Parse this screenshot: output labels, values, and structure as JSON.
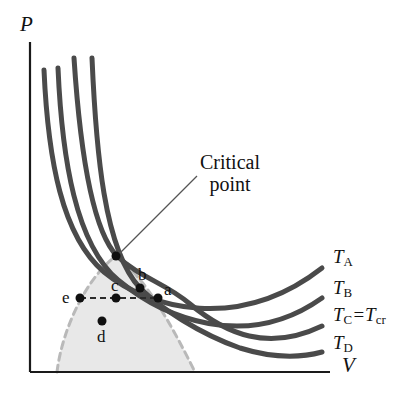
{
  "figure": {
    "kind": "pv-isotherm-diagram",
    "background": "#ffffff",
    "width": 409,
    "height": 399
  },
  "axes": {
    "y_label": "P",
    "x_label": "V",
    "color": "#1a1a1a",
    "origin": {
      "x": 30,
      "y": 372
    },
    "y_top": 42,
    "x_right": 330
  },
  "annotations": {
    "critical_point": {
      "line1": "Critical",
      "line2": "point",
      "text_x": 200,
      "text_y": 152,
      "leader_from": {
        "x": 197,
        "y": 176
      },
      "leader_to": {
        "x": 117,
        "y": 256
      }
    }
  },
  "curves": {
    "stroke": "#4a4a4a",
    "width": 5,
    "items": [
      {
        "id": "T_A",
        "label_main": "T",
        "label_sub": "A",
        "label_x": 333,
        "label_y": 258,
        "path": "M 44,70 C 48,160 62,236 104,272 C 150,310 240,332 322,268"
      },
      {
        "id": "T_B",
        "label_main": "T",
        "label_sub": "B",
        "label_x": 333,
        "label_y": 289,
        "path": "M 58,68 C 62,160 76,244 118,280 C 164,318 246,352 322,298"
      },
      {
        "id": "T_C",
        "label_main": "T",
        "label_sub": "C",
        "label_eq": "=",
        "label_main2": "T",
        "label_sub2": "cr",
        "label_x": 333,
        "label_y": 315,
        "path": "M 74,58 C 80,150 92,230 117,256 C 140,278 164,282 190,304 C 226,334 268,352 322,326"
      },
      {
        "id": "T_D",
        "label_main": "T",
        "label_sub": "D",
        "label_x": 333,
        "label_y": 344,
        "path": "M 92,58 C 96,150 104,250 140,288 C 160,308 200,334 240,348 C 272,358 300,358 322,352"
      }
    ]
  },
  "dome": {
    "fill": "#e8e8e8",
    "stroke": "#b9b9b9",
    "stroke_width": 3,
    "dash": "7,5",
    "path": "M 57,372 C 62,330 86,278 116,256 C 146,278 172,326 195,372"
  },
  "tie_line": {
    "from": {
      "x": 80,
      "y": 298
    },
    "to": {
      "x": 160,
      "y": 298
    },
    "stroke": "#2b2b2b",
    "dash": "6,4"
  },
  "points": [
    {
      "id": "a",
      "label": "a",
      "x": 158,
      "y": 298,
      "label_x": 164,
      "label_y": 281
    },
    {
      "id": "b",
      "label": "b",
      "x": 140,
      "y": 288,
      "label_x": 138,
      "label_y": 266
    },
    {
      "id": "c",
      "label": "c",
      "x": 116,
      "y": 298,
      "label_x": 111,
      "label_y": 277
    },
    {
      "id": "d",
      "label": "d",
      "x": 102,
      "y": 321,
      "label_x": 97,
      "label_y": 328
    },
    {
      "id": "e",
      "label": "e",
      "x": 80,
      "y": 298,
      "label_x": 62,
      "label_y": 289
    },
    {
      "id": "critical",
      "label": "",
      "x": 116,
      "y": 256,
      "label_x": 0,
      "label_y": 0
    }
  ],
  "point_style": {
    "fill": "#101010",
    "radius": 4.5
  }
}
